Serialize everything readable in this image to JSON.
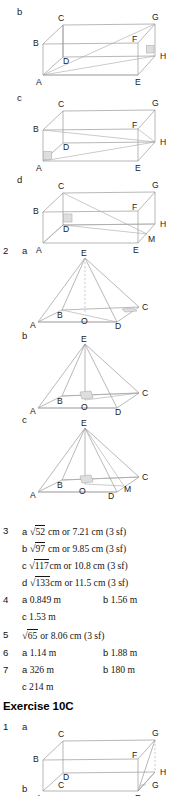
{
  "page": {
    "width": 178,
    "height": 795,
    "background": "#ffffff",
    "edge_color": "#9a9a9a",
    "text_color": "#1a1a1a"
  },
  "diagrams": {
    "cuboid_b": {
      "part_label": "b",
      "vertices": [
        "C",
        "G",
        "B",
        "F",
        "D",
        "H",
        "A",
        "E"
      ],
      "right_angle_at": "H"
    },
    "cuboid_c": {
      "part_label": "c",
      "vertices": [
        "C",
        "G",
        "B",
        "F",
        "D",
        "H",
        "A",
        "E"
      ],
      "right_angle_at": "A"
    },
    "cuboid_d": {
      "part_label": "d",
      "vertices": [
        "C",
        "G",
        "B",
        "F",
        "D",
        "H",
        "A",
        "E",
        "M"
      ],
      "right_angle_at": "D"
    },
    "pyramid_a": {
      "part_label": "a",
      "vertices": [
        "E",
        "B",
        "C",
        "A",
        "O",
        "D"
      ],
      "right_angle_at": "C"
    },
    "pyramid_b": {
      "part_label": "b",
      "vertices": [
        "E",
        "B",
        "C",
        "A",
        "O",
        "D"
      ],
      "right_angle_at": "O"
    },
    "pyramid_c": {
      "part_label": "c",
      "vertices": [
        "E",
        "B",
        "C",
        "A",
        "O",
        "M",
        "D"
      ],
      "right_angle_at": "O"
    },
    "cuboid_1a": {
      "part_label": "a",
      "vertices": [
        "C",
        "G",
        "B",
        "F",
        "D",
        "H",
        "A",
        "E"
      ]
    },
    "partial_bottom": {
      "part_label": "b",
      "vertices": [
        "C",
        "G"
      ]
    }
  },
  "answers": [
    {
      "number": "3",
      "items": [
        {
          "letter": "a",
          "surd": "52",
          "text": " cm or 7.21 cm (3 sf)"
        },
        {
          "letter": "b",
          "surd": "97",
          "text": " cm or 9.85 cm (3 sf)"
        },
        {
          "letter": "c",
          "surd": "117",
          "text": "cm or 10.8 cm (3 sf)"
        },
        {
          "letter": "d",
          "surd": "133",
          "text": "cm or 11.5 cm (3 sf)"
        }
      ]
    },
    {
      "number": "4",
      "items": [
        {
          "letter": "a",
          "text": "0.849 m"
        },
        {
          "letter": "b",
          "text": "1.56 m"
        },
        {
          "letter": "c",
          "text": "1.53 m"
        }
      ]
    },
    {
      "number": "5",
      "items": [
        {
          "letter": "",
          "surd": "65",
          "text": " or 8.06 cm (3 sf)"
        }
      ]
    },
    {
      "number": "6",
      "items": [
        {
          "letter": "a",
          "text": "1.14 m"
        },
        {
          "letter": "b",
          "text": "1.88 m"
        }
      ]
    },
    {
      "number": "7",
      "items": [
        {
          "letter": "a",
          "text": "326 m"
        },
        {
          "letter": "b",
          "text": "180 m"
        },
        {
          "letter": "c",
          "text": "214 m"
        }
      ]
    }
  ],
  "question_numbers": {
    "two": "2",
    "three": "3",
    "four": "4",
    "five": "5",
    "six": "6",
    "seven": "7",
    "one": "1"
  },
  "exercise_heading": "Exercise 10C"
}
